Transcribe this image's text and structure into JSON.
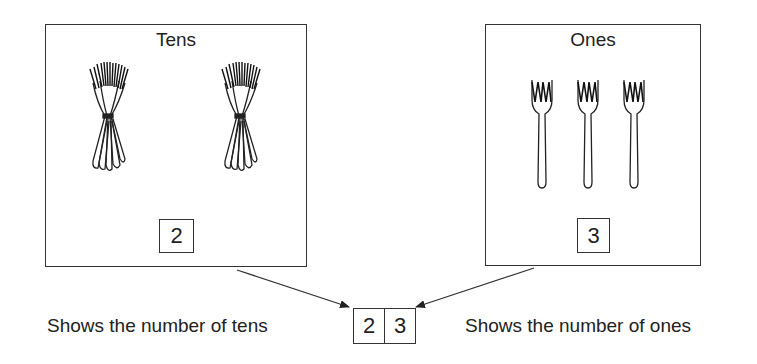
{
  "tens_panel": {
    "title": "Tens",
    "bundle_count": 2,
    "digit": "2"
  },
  "ones_panel": {
    "title": "Ones",
    "fork_count": 3,
    "digit": "3"
  },
  "number": {
    "tens_digit": "2",
    "ones_digit": "3"
  },
  "captions": {
    "left": "Shows the number of tens",
    "right": "Shows the number of ones"
  },
  "colors": {
    "line": "#333333",
    "background": "#ffffff"
  }
}
